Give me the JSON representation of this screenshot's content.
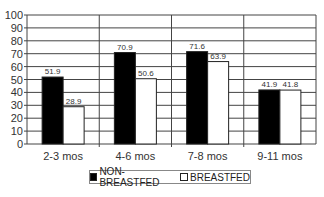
{
  "chart_data": {
    "type": "bar",
    "title": "",
    "xlabel": "",
    "ylabel": "",
    "ylim": [
      0,
      100
    ],
    "yticks": [
      0,
      10,
      20,
      30,
      40,
      50,
      60,
      70,
      80,
      90,
      100
    ],
    "grid": true,
    "legend_position": "bottom",
    "categories": [
      "2-3 mos",
      "4-6 mos",
      "7-8 mos",
      "9-11 mos"
    ],
    "series": [
      {
        "name": "NON-BREASTFED",
        "color": "#000000",
        "values": [
          51.9,
          70.9,
          71.6,
          41.9
        ]
      },
      {
        "name": "BREASTFED",
        "color": "#ffffff",
        "values": [
          28.9,
          50.6,
          63.9,
          41.8
        ]
      }
    ]
  }
}
